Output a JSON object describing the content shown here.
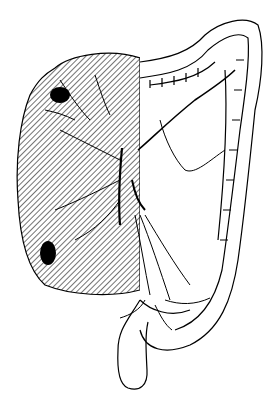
{
  "figure": {
    "type": "anatomical line illustration",
    "background": "#ffffff",
    "ink_color": "#000000",
    "regions": [
      {
        "name": "hatched-resection-region",
        "pattern": "diagonal hatch",
        "side": "right colon"
      },
      {
        "name": "tumor-upper",
        "fill": "#000000"
      },
      {
        "name": "tumor-lower",
        "fill": "#000000"
      }
    ],
    "labels": []
  }
}
